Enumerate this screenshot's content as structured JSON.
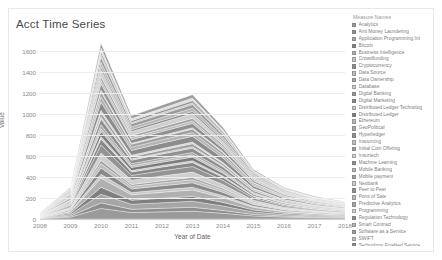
{
  "card": {
    "title": "Acct Time Series"
  },
  "legend": {
    "title": "Measure Names",
    "items": [
      {
        "label": "Analytics",
        "color": "#9a9a9a"
      },
      {
        "label": "Anti Money Laundering",
        "color": "#8e8e8e"
      },
      {
        "label": "Application Programming Int",
        "color": "#a6a6a6"
      },
      {
        "label": "Bitcoin",
        "color": "#7f7f7f"
      },
      {
        "label": "Business Intelligence",
        "color": "#b0b0b0"
      },
      {
        "label": "Crowdfunding",
        "color": "#c6c6c6"
      },
      {
        "label": "Cryptocurrency",
        "color": "#8a8a8a"
      },
      {
        "label": "Data Source",
        "color": "#bdbdbd"
      },
      {
        "label": "Data Ownership",
        "color": "#a2a2a2"
      },
      {
        "label": "Database",
        "color": "#cfcfcf"
      },
      {
        "label": "Digital Banking",
        "color": "#949494"
      },
      {
        "label": "Digital Marketing",
        "color": "#868686"
      },
      {
        "label": "Distributed Ledger Technolog",
        "color": "#c9c9c9"
      },
      {
        "label": "Distributed Ledger",
        "color": "#7b7b7b"
      },
      {
        "label": "Ethereum",
        "color": "#b8b8b8"
      },
      {
        "label": "GeoPolitical",
        "color": "#a9a9a9"
      },
      {
        "label": "Hyperledger",
        "color": "#8f8f8f"
      },
      {
        "label": "Insourcing",
        "color": "#c2c2c2"
      },
      {
        "label": "Initial Coin Offering",
        "color": "#9e9e9e"
      },
      {
        "label": "Insurtech",
        "color": "#d2d2d2"
      },
      {
        "label": "Machine Learning",
        "color": "#8c8c8c"
      },
      {
        "label": "Mobile Banking",
        "color": "#b4b4b4"
      },
      {
        "label": "Mobile payment",
        "color": "#a0a0a0"
      },
      {
        "label": "Neobank",
        "color": "#cbcbcb"
      },
      {
        "label": "Peer to Peer",
        "color": "#909090"
      },
      {
        "label": "Point of Sale",
        "color": "#bbbbbb"
      },
      {
        "label": "Predictive Analytics",
        "color": "#a4a4a4"
      },
      {
        "label": "Programming",
        "color": "#d0d0d0"
      },
      {
        "label": "Regulation Technology",
        "color": "#898989"
      },
      {
        "label": "Smart Contract",
        "color": "#b6b6b6"
      },
      {
        "label": "Software as a Service",
        "color": "#9c9c9c"
      },
      {
        "label": "SWIFT",
        "color": "#c4c4c4"
      },
      {
        "label": "Technology Enabled Service",
        "color": "#878787"
      },
      {
        "label": "Tokenization",
        "color": "#bfbfbf"
      },
      {
        "label": "Validation",
        "color": "#d4d4d4"
      },
      {
        "label": "Wealth Management",
        "color": "#9b9b9b"
      }
    ]
  },
  "chart_data": {
    "type": "area",
    "title": "Acct Time Series",
    "xlabel": "Year of Date",
    "ylabel": "Value",
    "xlim": [
      2008,
      2018
    ],
    "ylim": [
      0,
      1700
    ],
    "yticks": [
      0,
      200,
      400,
      600,
      800,
      1000,
      1200,
      1400,
      1600
    ],
    "categories": [
      2008,
      2009,
      2010,
      2011,
      2012,
      2013,
      2014,
      2015,
      2016,
      2017,
      2018
    ],
    "grid": true,
    "legend_position": "right",
    "stacked": true,
    "total": [
      60,
      300,
      1670,
      980,
      1080,
      1180,
      870,
      470,
      300,
      215,
      165
    ],
    "series": [
      {
        "name": "Analytics",
        "values": [
          4,
          18,
          92,
          56,
          62,
          68,
          50,
          27,
          17,
          12,
          9
        ]
      },
      {
        "name": "Anti Money Laundering",
        "values": [
          2,
          9,
          48,
          28,
          31,
          34,
          25,
          13,
          8,
          6,
          5
        ]
      },
      {
        "name": "Application Programming Int",
        "values": [
          3,
          14,
          75,
          44,
          48,
          53,
          39,
          21,
          13,
          10,
          7
        ]
      },
      {
        "name": "Bitcoin",
        "values": [
          2,
          11,
          60,
          35,
          39,
          42,
          31,
          17,
          11,
          8,
          6
        ]
      },
      {
        "name": "Business Intelligence",
        "values": [
          3,
          15,
          80,
          47,
          52,
          57,
          42,
          23,
          14,
          10,
          8
        ]
      },
      {
        "name": "Crowdfunding",
        "values": [
          1,
          6,
          33,
          19,
          21,
          23,
          17,
          9,
          6,
          4,
          3
        ]
      },
      {
        "name": "Cryptocurrency",
        "values": [
          2,
          10,
          55,
          32,
          35,
          39,
          29,
          15,
          10,
          7,
          5
        ]
      },
      {
        "name": "Data Source",
        "values": [
          1,
          7,
          38,
          22,
          25,
          27,
          20,
          11,
          7,
          5,
          4
        ]
      },
      {
        "name": "Data Ownership",
        "values": [
          1,
          5,
          28,
          16,
          18,
          20,
          15,
          8,
          5,
          4,
          3
        ]
      },
      {
        "name": "Database",
        "values": [
          2,
          12,
          64,
          38,
          42,
          46,
          34,
          18,
          12,
          8,
          6
        ]
      },
      {
        "name": "Digital Banking",
        "values": [
          3,
          13,
          70,
          41,
          45,
          49,
          36,
          19,
          12,
          9,
          7
        ]
      },
      {
        "name": "Digital Marketing",
        "values": [
          2,
          9,
          50,
          29,
          32,
          35,
          26,
          14,
          9,
          6,
          5
        ]
      },
      {
        "name": "Distributed Ledger Technolog",
        "values": [
          1,
          4,
          22,
          13,
          14,
          16,
          12,
          6,
          4,
          3,
          2
        ]
      },
      {
        "name": "Distributed Ledger",
        "values": [
          2,
          8,
          44,
          26,
          28,
          31,
          23,
          12,
          8,
          6,
          4
        ]
      },
      {
        "name": "Ethereum",
        "values": [
          1,
          5,
          27,
          16,
          17,
          19,
          14,
          8,
          5,
          4,
          3
        ]
      },
      {
        "name": "GeoPolitical",
        "values": [
          1,
          6,
          31,
          18,
          20,
          22,
          16,
          9,
          6,
          4,
          3
        ]
      },
      {
        "name": "Hyperledger",
        "values": [
          2,
          10,
          52,
          30,
          34,
          37,
          27,
          15,
          9,
          7,
          5
        ]
      },
      {
        "name": "Insourcing",
        "values": [
          1,
          3,
          18,
          10,
          11,
          13,
          9,
          5,
          3,
          2,
          2
        ]
      },
      {
        "name": "Initial Coin Offering",
        "values": [
          1,
          7,
          36,
          21,
          23,
          26,
          19,
          10,
          7,
          5,
          4
        ]
      },
      {
        "name": "Insurtech",
        "values": [
          1,
          4,
          20,
          12,
          13,
          14,
          11,
          6,
          4,
          3,
          2
        ]
      },
      {
        "name": "Machine Learning",
        "values": [
          3,
          14,
          72,
          42,
          47,
          51,
          38,
          20,
          13,
          9,
          7
        ]
      },
      {
        "name": "Mobile Banking",
        "values": [
          2,
          9,
          47,
          28,
          30,
          33,
          25,
          13,
          8,
          6,
          5
        ]
      },
      {
        "name": "Mobile payment",
        "values": [
          2,
          8,
          42,
          25,
          27,
          30,
          22,
          12,
          8,
          6,
          4
        ]
      },
      {
        "name": "Neobank",
        "values": [
          1,
          3,
          16,
          9,
          10,
          11,
          8,
          5,
          3,
          2,
          2
        ]
      },
      {
        "name": "Peer to Peer",
        "values": [
          2,
          10,
          53,
          31,
          34,
          38,
          28,
          15,
          10,
          7,
          5
        ]
      },
      {
        "name": "Point of Sale",
        "values": [
          1,
          6,
          30,
          18,
          19,
          21,
          16,
          8,
          5,
          4,
          3
        ]
      },
      {
        "name": "Predictive Analytics",
        "values": [
          1,
          7,
          34,
          20,
          22,
          24,
          18,
          10,
          6,
          5,
          3
        ]
      },
      {
        "name": "Programming",
        "values": [
          2,
          11,
          58,
          34,
          37,
          41,
          30,
          16,
          10,
          8,
          6
        ]
      },
      {
        "name": "Regulation Technology",
        "values": [
          1,
          5,
          26,
          15,
          17,
          18,
          14,
          7,
          5,
          3,
          3
        ]
      },
      {
        "name": "Smart Contract",
        "values": [
          2,
          8,
          40,
          24,
          26,
          29,
          21,
          11,
          7,
          5,
          4
        ]
      },
      {
        "name": "Software as a Service",
        "values": [
          2,
          9,
          46,
          27,
          30,
          32,
          24,
          13,
          8,
          6,
          5
        ]
      },
      {
        "name": "SWIFT",
        "values": [
          1,
          4,
          21,
          12,
          13,
          15,
          11,
          6,
          4,
          3,
          2
        ]
      },
      {
        "name": "Technology Enabled Service",
        "values": [
          1,
          5,
          24,
          14,
          16,
          17,
          13,
          7,
          4,
          3,
          2
        ]
      },
      {
        "name": "Tokenization",
        "values": [
          1,
          3,
          14,
          8,
          9,
          10,
          7,
          4,
          3,
          2,
          2
        ]
      },
      {
        "name": "Validation",
        "values": [
          1,
          4,
          19,
          11,
          12,
          14,
          10,
          5,
          3,
          3,
          2
        ]
      },
      {
        "name": "Wealth Management",
        "values": [
          2,
          8,
          41,
          24,
          26,
          29,
          21,
          11,
          7,
          5,
          4
        ]
      }
    ]
  }
}
